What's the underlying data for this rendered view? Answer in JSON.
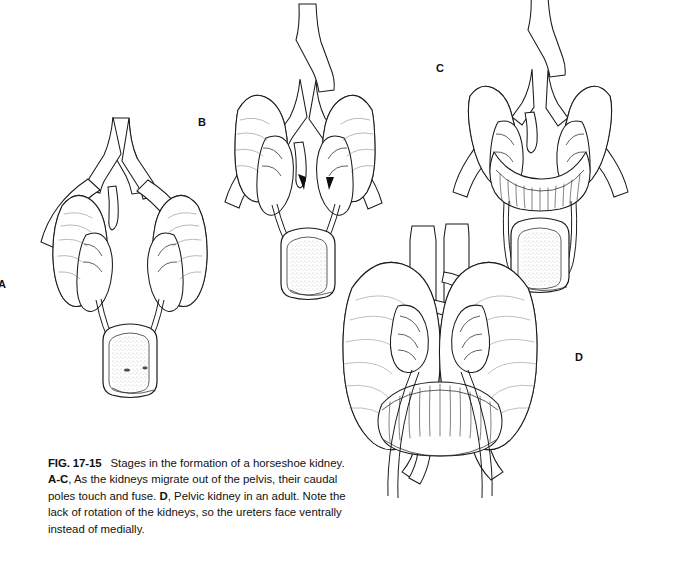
{
  "figure": {
    "number": "FIG. 17-15",
    "caption_segments": [
      {
        "text": "FIG. 17-15",
        "bold": true
      },
      {
        "text": "Stages in the formation of a horseshoe kidney. ",
        "bold": false
      },
      {
        "text": "A-C",
        "bold": true
      },
      {
        "text": ", As the kidneys migrate out of the pelvis, their caudal poles touch and fuse. ",
        "bold": false
      },
      {
        "text": "D",
        "bold": true
      },
      {
        "text": ", Pelvic kidney in an adult. Note the lack of rotation of the kidneys, so the ureters face ventrally instead of medially.",
        "bold": false
      }
    ],
    "caption_plain": "FIG. 17-15 Stages in the formation of a horseshoe kidney. A-C, As the kidneys migrate out of the pelvis, their caudal poles touch and fuse. D, Pelvic kidney in an adult. Note the lack of rotation of the kidneys, so the ureters face ventrally instead of medially.",
    "caption_line_1_a": "FIG. 17-15",
    "caption_line_1_b": "Stages in the formation of a horseshoe",
    "caption_line_2_a": "kidney. ",
    "caption_line_2_b": "A-C",
    "caption_line_2_c": ", As the kidneys migrate out of the pelvis,",
    "caption_line_3_a": "their caudal poles touch and fuse. ",
    "caption_line_3_b": "D",
    "caption_line_3_c": ", Pelvic kidney in an",
    "caption_line_4": "adult. Note the lack of rotation of the kidneys, so the",
    "caption_line_5": "ureters face ventrally instead of medially."
  },
  "panels": [
    {
      "id": "a",
      "label": "A",
      "title": "Pelvic kidneys before ascent"
    },
    {
      "id": "b",
      "label": "B",
      "title": "Kidneys migrating, caudal poles approaching"
    },
    {
      "id": "c",
      "label": "C",
      "title": "Caudal poles fused into horseshoe"
    },
    {
      "id": "d",
      "label": "D",
      "title": "Adult pelvic horseshoe kidney"
    }
  ],
  "colors": {
    "background": "#ffffff",
    "ink": "#1a1a1a",
    "hatch": "#3a3a3a",
    "text": "#111111"
  }
}
